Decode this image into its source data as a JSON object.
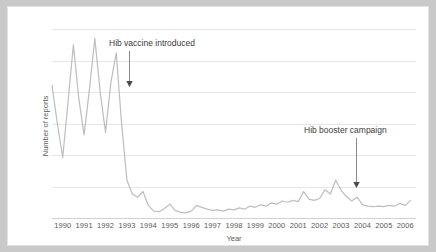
{
  "chart_data": {
    "type": "line",
    "title": "",
    "xlabel": "Year",
    "ylabel": "Number of reports",
    "ylim": [
      0,
      300
    ],
    "yticks": [
      0,
      50,
      100,
      150,
      200,
      250,
      300
    ],
    "xlim": [
      1990,
      2007
    ],
    "categories": [
      "1990",
      "1991",
      "1992",
      "1993",
      "1994",
      "1995",
      "1996",
      "1997",
      "1998",
      "1999",
      "2000",
      "2001",
      "2002",
      "2003",
      "2004",
      "2005",
      "2006"
    ],
    "grid": true,
    "legend": null,
    "series": [
      {
        "name": "Hib reports",
        "color": "#bfbfbf",
        "x": [
          1990.0,
          1990.25,
          1990.5,
          1990.75,
          1991.0,
          1991.25,
          1991.5,
          1991.75,
          1992.0,
          1992.25,
          1992.5,
          1992.75,
          1993.0,
          1993.25,
          1993.5,
          1993.75,
          1994.0,
          1994.25,
          1994.5,
          1994.75,
          1995.0,
          1995.25,
          1995.5,
          1995.75,
          1996.0,
          1996.25,
          1996.5,
          1996.75,
          1997.0,
          1997.25,
          1997.5,
          1997.75,
          1998.0,
          1998.25,
          1998.5,
          1998.75,
          1999.0,
          1999.25,
          1999.5,
          1999.75,
          2000.0,
          2000.25,
          2000.5,
          2000.75,
          2001.0,
          2001.25,
          2001.5,
          2001.75,
          2002.0,
          2002.25,
          2002.5,
          2002.75,
          2003.0,
          2003.25,
          2003.5,
          2003.75,
          2004.0,
          2004.25,
          2004.5,
          2004.75,
          2005.0,
          2005.25,
          2005.5,
          2005.75,
          2006.0,
          2006.25,
          2006.5,
          2006.75
        ],
        "values": [
          210,
          150,
          96,
          185,
          275,
          190,
          132,
          205,
          285,
          200,
          136,
          215,
          262,
          150,
          60,
          38,
          33,
          42,
          20,
          11,
          10,
          15,
          22,
          12,
          9,
          8,
          11,
          20,
          17,
          14,
          12,
          13,
          11,
          14,
          13,
          16,
          14,
          19,
          17,
          21,
          19,
          24,
          22,
          27,
          25,
          28,
          26,
          42,
          30,
          28,
          31,
          45,
          38,
          60,
          44,
          34,
          27,
          33,
          21,
          19,
          18,
          19,
          18,
          20,
          19,
          23,
          20,
          28
        ]
      }
    ],
    "annotations": [
      {
        "id": "hib-vaccine-introduced",
        "text": "Hib vaccine introduced",
        "text_x": 101,
        "text_y": 31,
        "arrow_x": 121,
        "arrow_top": 44,
        "arrow_bottom": 80
      },
      {
        "id": "hib-booster-campaign",
        "text": "Hib booster campaign",
        "text_x": 296,
        "text_y": 118,
        "arrow_x": 348,
        "arrow_top": 131,
        "arrow_bottom": 181
      }
    ]
  }
}
